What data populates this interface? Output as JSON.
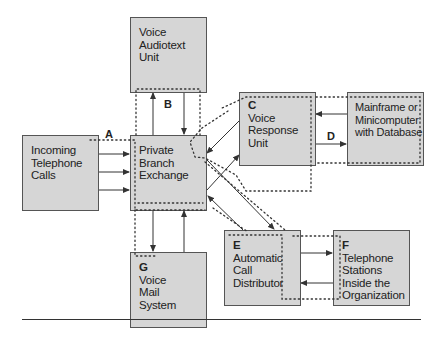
{
  "diagram": {
    "type": "call-processing-flow",
    "nodes": {
      "incoming": {
        "tag": "",
        "lines": [
          "Incoming",
          "Telephone",
          "Calls"
        ]
      },
      "pbx": {
        "tag": "",
        "lines": [
          "Private",
          "Branch",
          "Exchange"
        ]
      },
      "audiotext": {
        "tag": "",
        "lines": [
          "Voice",
          "Audiotext",
          "Unit"
        ]
      },
      "vru": {
        "tag": "C",
        "lines": [
          "Voice",
          "Response",
          "Unit"
        ]
      },
      "mainframe": {
        "tag": "",
        "lines": [
          "Mainframe or",
          "Minicomputer",
          "with Database"
        ]
      },
      "acd": {
        "tag": "E",
        "lines": [
          "Automatic",
          "Call",
          "Distributor"
        ]
      },
      "stations": {
        "tag": "F",
        "lines": [
          "Telephone",
          "Stations",
          "Inside the",
          "Organization"
        ]
      },
      "voicemail": {
        "tag": "G",
        "lines": [
          "Voice",
          "Mail",
          "System"
        ]
      }
    },
    "path_labels": {
      "a": "A",
      "b": "B",
      "d": "D"
    },
    "edges": [
      {
        "from": "incoming",
        "to": "pbx",
        "count": 3
      },
      {
        "from": "pbx",
        "to": "audiotext"
      },
      {
        "from": "audiotext",
        "to": "pbx"
      },
      {
        "from": "pbx",
        "to": "vru"
      },
      {
        "from": "vru",
        "to": "pbx"
      },
      {
        "from": "vru",
        "to": "mainframe",
        "label": "D"
      },
      {
        "from": "mainframe",
        "to": "vru"
      },
      {
        "from": "pbx",
        "to": "acd"
      },
      {
        "from": "acd",
        "to": "pbx"
      },
      {
        "from": "acd",
        "to": "stations"
      },
      {
        "from": "stations",
        "to": "acd"
      },
      {
        "from": "pbx",
        "to": "voicemail"
      },
      {
        "from": "voicemail",
        "to": "pbx"
      }
    ],
    "colors": {
      "box_fill": "#d6d6d6",
      "box_border": "#555555",
      "line": "#333333"
    }
  }
}
